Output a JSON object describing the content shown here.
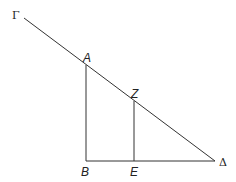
{
  "diagram": {
    "type": "geometry",
    "points": {
      "Gamma": {
        "label": "Γ",
        "x": 24,
        "y": 18
      },
      "A": {
        "label": "A",
        "x": 86,
        "y": 65
      },
      "Z": {
        "label": "Z",
        "x": 134,
        "y": 101
      },
      "B": {
        "label": "B",
        "x": 86,
        "y": 161
      },
      "E": {
        "label": "E",
        "x": 134,
        "y": 161
      },
      "Delta": {
        "label": "Δ",
        "x": 215,
        "y": 161
      }
    },
    "segments": [
      "Gamma-Delta",
      "A-B",
      "Z-E",
      "B-Delta"
    ]
  }
}
